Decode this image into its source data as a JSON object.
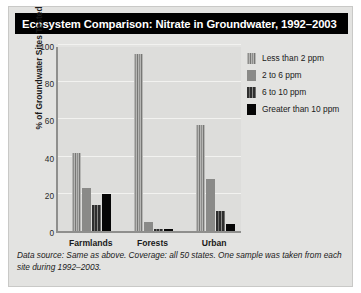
{
  "chart_data": {
    "type": "bar",
    "title": "Ecosystem Comparison: Nitrate in Groundwater, 1992–2003",
    "xlabel": "",
    "ylabel": "% of Groundwater Sites Tested",
    "ylim": [
      0,
      100
    ],
    "yticks": [
      0,
      20,
      40,
      60,
      80,
      100
    ],
    "grid": true,
    "legend_position": "top-right",
    "categories": [
      "Farmlands",
      "Forests",
      "Urban"
    ],
    "series": [
      {
        "name": "Less than 2 ppm",
        "values": [
          42,
          95,
          57
        ],
        "color": "#b6b6b4",
        "pattern": "vertical-stripe-light"
      },
      {
        "name": "2 to 6 ppm",
        "values": [
          23,
          5,
          28
        ],
        "color": "#8a8a88",
        "pattern": "solid"
      },
      {
        "name": "6 to 10 ppm",
        "values": [
          14,
          1,
          11
        ],
        "color": "#2e2e2e",
        "pattern": "vertical-stripe-dark"
      },
      {
        "name": "Greater than 10 ppm",
        "values": [
          20,
          1,
          4
        ],
        "color": "#060606",
        "pattern": "solid"
      }
    ],
    "footnote": "Data source: Same as above. Coverage: all 50 states. One sample was taken from each site during 1992–2003."
  },
  "colors": {
    "panel_background": "#e3e3e1",
    "plot_background": "#dddddb",
    "title_background": "#000000",
    "title_text": "#ffffff",
    "axis": "#8f8f8d",
    "gridline": "#f2f2f0"
  }
}
